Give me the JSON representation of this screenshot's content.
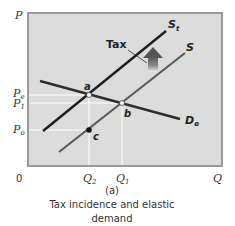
{
  "diagram": {
    "title": "Tax incidence and elastic demand",
    "panel_label": "(a)",
    "caption_line1": "Tax incidence and elastic",
    "caption_line2": "demand",
    "axes": {
      "y_label": "P",
      "x_label": "Q",
      "origin_label": "0"
    },
    "price_ticks": [
      {
        "base": "P",
        "sub": "e"
      },
      {
        "base": "P",
        "sub": "1"
      },
      {
        "base": "P",
        "sub": "o"
      }
    ],
    "quantity_ticks": [
      {
        "base": "Q",
        "sub": "2"
      },
      {
        "base": "Q",
        "sub": "1"
      }
    ],
    "curves": {
      "supply_with_tax": {
        "base": "S",
        "sub": "t"
      },
      "supply": {
        "base": "S",
        "sub": ""
      },
      "demand": {
        "base": "D",
        "sub": "e"
      }
    },
    "points": {
      "a": "a",
      "b": "b",
      "c": "c"
    },
    "tax_label": "Tax",
    "colors": {
      "plot_bg": "#dcdcdc",
      "plot_border": "#9a9a9a",
      "supply_tax_line": "#1e1e1e",
      "supply_line": "#5a5a5a",
      "demand_line": "#2e2e2e",
      "arrow_top": "#555555",
      "arrow_bottom": "#e8e8e8"
    }
  }
}
